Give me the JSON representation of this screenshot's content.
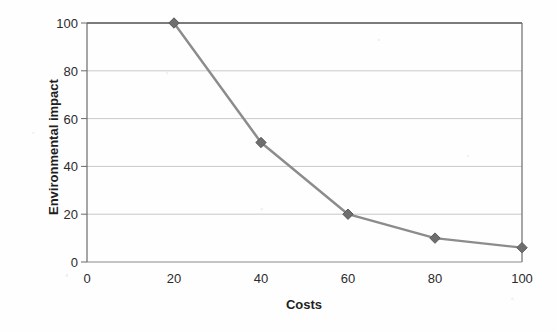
{
  "chart_data": {
    "type": "line",
    "title": "",
    "subtitle": "",
    "xlabel": "Costs",
    "ylabel": "Environmental impact",
    "x": [
      20,
      40,
      60,
      80,
      100
    ],
    "series": [
      {
        "name": "Environmental impact vs Costs",
        "values": [
          100,
          50,
          20,
          10,
          6
        ]
      }
    ],
    "xlim": [
      0,
      100
    ],
    "ylim": [
      0,
      100
    ],
    "xticks": [
      "0",
      "20",
      "40",
      "60",
      "80",
      "100"
    ],
    "xtick_values": [
      0,
      20,
      40,
      60,
      80,
      100
    ],
    "yticks": [
      "0",
      "20",
      "40",
      "60",
      "80",
      "100"
    ],
    "ytick_values": [
      0,
      20,
      40,
      60,
      80,
      100
    ],
    "grid": "horizontal",
    "legend": "none",
    "marker": "diamond",
    "colors": {
      "line": "#8c8c8c",
      "marker": "#6e6e6e",
      "gridline": "#c9c9c9",
      "axis": "#6b6b6b",
      "plot_border": "#555555",
      "text": "#2b2b2b",
      "background": "#fefefe"
    }
  },
  "axes": {
    "x_title": "Costs",
    "y_title": "Environmental impact",
    "x_tick_labels": [
      "0",
      "20",
      "40",
      "60",
      "80",
      "100"
    ],
    "y_tick_labels": [
      "0",
      "20",
      "40",
      "60",
      "80",
      "100"
    ]
  }
}
